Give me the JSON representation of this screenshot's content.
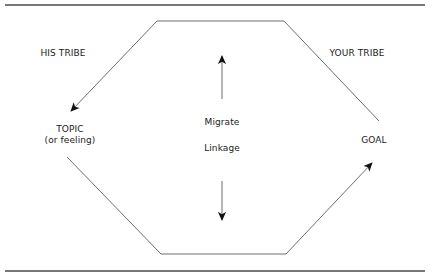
{
  "diagram": {
    "labels": {
      "his_tribe": "HIS TRIBE",
      "your_tribe": "YOUR TRIBE",
      "topic": "TOPIC",
      "topic_sub": "(or feeling)",
      "goal": "GOAL",
      "migrate": "Migrate",
      "linkage": "Linkage"
    },
    "colors": {
      "line": "#6e6e6e",
      "rule": "#4a4a4a",
      "arrow": "#111111",
      "text": "#1a1a1a"
    }
  }
}
